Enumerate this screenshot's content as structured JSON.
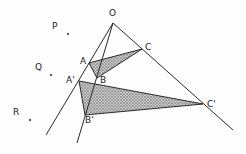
{
  "diagram": {
    "type": "geometry-perspective-triangles",
    "colors": {
      "line": "#2a2a2a",
      "shade_fill": "#9a9a9a",
      "background": "#fdfdfd"
    },
    "points": {
      "O": {
        "label": "O",
        "x": 113,
        "y": 23,
        "lx": 109,
        "ly": 9
      },
      "A": {
        "label": "A",
        "x": 89,
        "y": 63,
        "lx": 80,
        "ly": 57
      },
      "B": {
        "label": "B",
        "x": 97,
        "y": 78,
        "lx": 100,
        "ly": 76
      },
      "C": {
        "label": "C",
        "x": 142,
        "y": 49,
        "lx": 145,
        "ly": 43
      },
      "A_prime": {
        "label": "A'",
        "x": 79,
        "y": 81,
        "lx": 66,
        "ly": 76
      },
      "B_prime": {
        "label": "B'",
        "x": 85,
        "y": 115,
        "lx": 85,
        "ly": 116
      },
      "C_prime": {
        "label": "C'",
        "x": 203,
        "y": 104,
        "lx": 207,
        "ly": 100
      }
    },
    "free_points": [
      {
        "label": "P",
        "dot_x": 68,
        "dot_y": 34,
        "lx": 52,
        "ly": 22
      },
      {
        "label": "Q",
        "dot_x": 51,
        "dot_y": 75,
        "lx": 35,
        "ly": 63
      },
      {
        "label": "R",
        "dot_x": 30,
        "dot_y": 120,
        "lx": 13,
        "ly": 108
      }
    ],
    "rays": [
      {
        "name": "ray-OA",
        "from": [
          113,
          23
        ],
        "to": [
          46,
          135
        ]
      },
      {
        "name": "ray-OB",
        "from": [
          113,
          23
        ],
        "to": [
          77,
          143
        ]
      },
      {
        "name": "ray-OC",
        "from": [
          113,
          23
        ],
        "to": [
          233,
          130
        ]
      }
    ],
    "triangles": [
      {
        "name": "triangle-ABC",
        "vertices": [
          "A",
          "B",
          "C"
        ],
        "shaded": true
      },
      {
        "name": "triangle-A'B'C'",
        "vertices": [
          "A'",
          "B'",
          "C'"
        ],
        "shaded": true
      }
    ]
  }
}
